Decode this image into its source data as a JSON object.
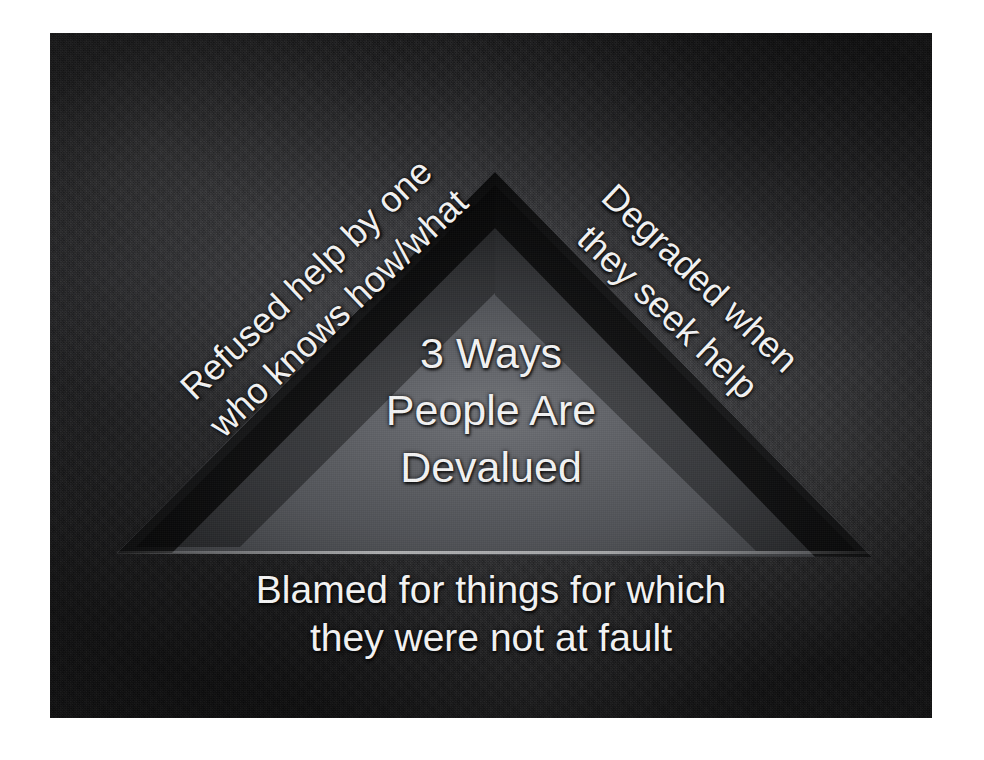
{
  "slide": {
    "center_title": {
      "lines": [
        "3 Ways",
        "People Are",
        "Devalued"
      ],
      "line1": "3 Ways",
      "line2": "People Are",
      "line3": "Devalued"
    },
    "left_label": {
      "lines": [
        "Refused help by one",
        "who knows how/what"
      ],
      "line1": "Refused help by one",
      "line2": "who knows how/what"
    },
    "right_label": {
      "lines": [
        "Degraded when",
        "they seek help"
      ],
      "line1": "Degraded when",
      "line2": "they seek help"
    },
    "bottom_label": {
      "lines": [
        "Blamed for things for which",
        "they were not at fault"
      ],
      "line1": "Blamed for things for which",
      "line2": "they were not at fault"
    },
    "colors": {
      "text": "#f2f2f2",
      "background_dark": "#1b1b1c",
      "triangle_fill": "#5a5c60",
      "triangle_shadow": "#0d0d0e",
      "page_background": "#ffffff"
    },
    "shapes": {
      "triangle": {
        "name": "recessed-triangle",
        "apex": [
          445,
          139
        ],
        "bottom_left": [
          67,
          520
        ],
        "bottom_right": [
          822,
          524
        ]
      }
    }
  }
}
